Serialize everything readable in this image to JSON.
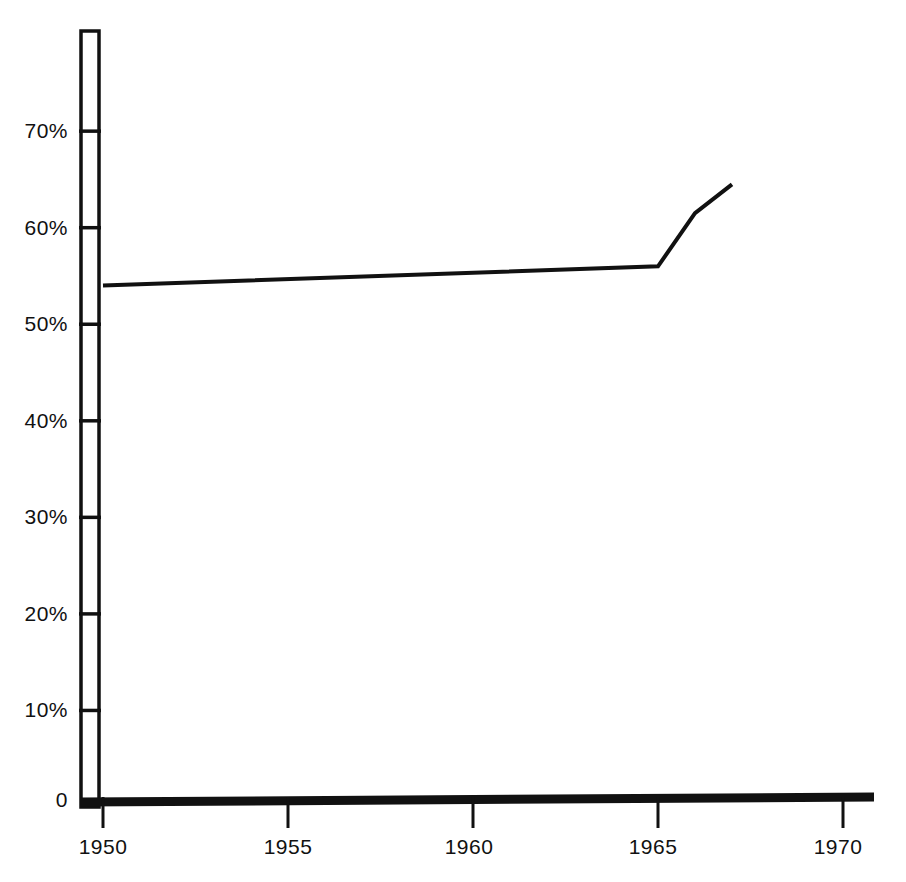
{
  "chart_data": {
    "type": "line",
    "title": "",
    "subtitle": "",
    "xlabel": "",
    "ylabel": "",
    "xlim": [
      1950,
      1971.5
    ],
    "ylim": [
      0,
      77
    ],
    "grid": false,
    "legend": null,
    "x_tick_labels": [
      "1950",
      "1955",
      "1960",
      "1965",
      "1970"
    ],
    "x_ticks": [
      1950,
      1955,
      1960,
      1965,
      1970
    ],
    "y_tick_labels": [
      "0",
      "10%",
      "20%",
      "30%",
      "40%",
      "50%",
      "60%",
      "70%"
    ],
    "y_ticks": [
      0,
      10,
      20,
      30,
      40,
      50,
      60,
      70
    ],
    "series": [
      {
        "name": "series-1",
        "color": "#111111",
        "x": [
          1950,
          1965,
          1966,
          1967
        ],
        "values": [
          54,
          56,
          61.5,
          64.5
        ]
      }
    ]
  },
  "axes": {
    "y_axis_name": "percent-axis",
    "x_axis_name": "year-axis",
    "y_labels": [
      {
        "text": "70%",
        "value": 70
      },
      {
        "text": "60%",
        "value": 60
      },
      {
        "text": "50%",
        "value": 50
      },
      {
        "text": "40%",
        "value": 40
      },
      {
        "text": "30%",
        "value": 30
      },
      {
        "text": "20%",
        "value": 20
      },
      {
        "text": "10%",
        "value": 10
      },
      {
        "text": "0",
        "value": 0
      }
    ],
    "x_labels": [
      {
        "text": "1950",
        "value": 1950
      },
      {
        "text": "1955",
        "value": 1955
      },
      {
        "text": "1960",
        "value": 1960
      },
      {
        "text": "1965",
        "value": 1965
      },
      {
        "text": "1970",
        "value": 1970
      }
    ]
  },
  "style": {
    "background": "#ffffff",
    "ink": "#111111",
    "line_color": "#111111"
  }
}
